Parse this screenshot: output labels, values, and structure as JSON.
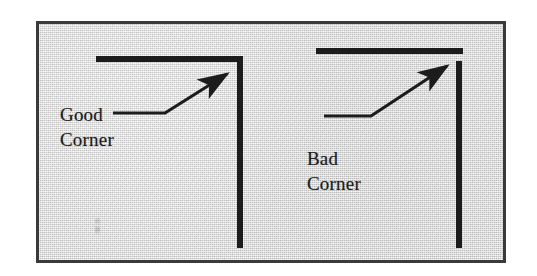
{
  "figure": {
    "kind": "corner-construction-diagram",
    "background_color": "#dedede",
    "frame_color": "#3a3a3a",
    "ink_color": "#1c1c1c"
  },
  "labels": {
    "good": "Good\nCorner",
    "bad": "Bad\nCorner"
  },
  "examples": [
    {
      "id": "good-corner",
      "label": "Good\nCorner",
      "description": "Horizontal member meets vertical member flush, forming a closed joined corner with no gap.",
      "horizontal_bar": {
        "x1": 57,
        "y1": 35,
        "x2": 204,
        "y2": 35,
        "thickness": 6
      },
      "vertical_bar": {
        "x1": 200,
        "y1": 35,
        "x2": 200,
        "y2": 224,
        "thickness": 6
      },
      "joint": "closed",
      "leader": {
        "tail": {
          "x": 74,
          "y": 89
        },
        "elbow": {
          "x": 125,
          "y": 89
        },
        "head": {
          "x": 190,
          "y": 48
        }
      }
    },
    {
      "id": "bad-corner",
      "label": "Bad\nCorner",
      "description": "Horizontal member stops short and sits above the vertical member, leaving an open unjoined corner with a visible gap.",
      "horizontal_bar": {
        "x1": 277,
        "y1": 27,
        "x2": 424,
        "y2": 27,
        "thickness": 6
      },
      "vertical_bar": {
        "x1": 420,
        "y1": 37,
        "x2": 420,
        "y2": 224,
        "thickness": 6
      },
      "joint": "open-gap",
      "gap_px": 4,
      "leader": {
        "tail": {
          "x": 285,
          "y": 92
        },
        "elbow": {
          "x": 330,
          "y": 92
        },
        "head": {
          "x": 410,
          "y": 40
        }
      }
    }
  ],
  "arrowhead": {
    "name": "solid-triangle-arrowhead",
    "length": 16,
    "width": 9
  }
}
